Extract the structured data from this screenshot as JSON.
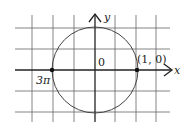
{
  "diagram": {
    "type": "unit-circle-on-grid",
    "axes": {
      "x_label": "x",
      "y_label": "y",
      "origin_label": "0"
    },
    "points": [
      {
        "label": "(1, 0)",
        "position": "right intersection of circle with x-axis"
      },
      {
        "label": "3π",
        "position": "left intersection of circle with x-axis"
      }
    ],
    "grid": {
      "vertical_lines": 7,
      "horizontal_lines": 5
    },
    "colors": {
      "grid": "#555555",
      "axis": "#222222",
      "circle": "#444444",
      "point": "#111111"
    }
  }
}
